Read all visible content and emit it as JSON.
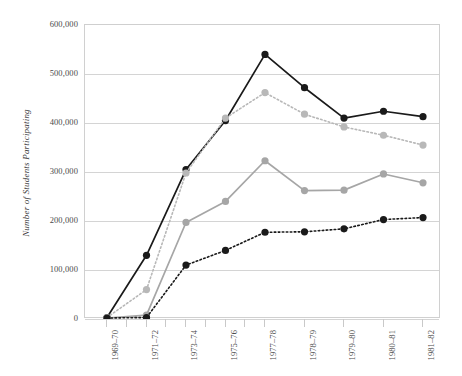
{
  "chart_data": {
    "type": "line",
    "title": "",
    "subtitle": "",
    "xlabel": "",
    "ylabel": "Number of Students Participating",
    "categories": [
      "1969–70",
      "1971–72",
      "1973–74",
      "1975–76",
      "1977–78",
      "1978–79",
      "1979–80",
      "1980–81",
      "1981–82"
    ],
    "ytick_labels": [
      "600,000",
      "500,000",
      "400,000",
      "300,000",
      "200,000",
      "100,000",
      "0"
    ],
    "ytick_values": [
      600000,
      500000,
      400000,
      300000,
      200000,
      100000,
      0
    ],
    "ylim": [
      0,
      600000
    ],
    "xlim_categories": 9,
    "grid": "horizontal",
    "legend": "none",
    "legend_position": "none",
    "series": [
      {
        "name": "series-black-solid",
        "color": "#1a1a1a",
        "style": "solid",
        "marker": "circle",
        "values": [
          3000,
          130000,
          305000,
          405000,
          540000,
          472000,
          410000,
          424000,
          413000
        ]
      },
      {
        "name": "series-lightgray-dotted",
        "color": "#b8b8b8",
        "style": "dotted",
        "marker": "circle",
        "values": [
          3000,
          60000,
          298000,
          410000,
          462000,
          418000,
          392000,
          375000,
          355000
        ]
      },
      {
        "name": "series-midgray-solid",
        "color": "#a6a6a6",
        "style": "solid",
        "marker": "circle",
        "values": [
          2000,
          8000,
          197000,
          240000,
          323000,
          262000,
          263000,
          296000,
          278000
        ]
      },
      {
        "name": "series-black-dotted",
        "color": "#1a1a1a",
        "style": "dotted",
        "marker": "circle",
        "values": [
          2000,
          3000,
          110000,
          140000,
          177000,
          178000,
          184000,
          203000,
          207000
        ]
      }
    ],
    "minor_ticks_between_categories": [
      1,
      2,
      3,
      4
    ]
  }
}
